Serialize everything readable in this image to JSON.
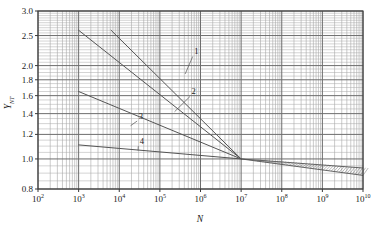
{
  "chart_data": {
    "type": "line",
    "title": "",
    "subtitle": "",
    "xlabel": "N",
    "ylabel": "Y_NT",
    "ylabel_base": "Y",
    "ylabel_sub": "NT",
    "xscale": "log",
    "yscale": "log",
    "xlim": [
      100,
      10000000000
    ],
    "ylim": [
      0.8,
      3.0
    ],
    "grid": true,
    "legend": "none",
    "x_tick_labels": [
      "10²",
      "10³",
      "10⁴",
      "10⁵",
      "10⁶",
      "10⁷",
      "10⁸",
      "10⁹",
      "10¹⁰"
    ],
    "x_tick_bases": [
      "10",
      "10",
      "10",
      "10",
      "10",
      "10",
      "10",
      "10",
      "10"
    ],
    "x_tick_exponents": [
      "2",
      "3",
      "4",
      "5",
      "6",
      "7",
      "8",
      "9",
      "10"
    ],
    "x_tick_values": [
      100,
      1000,
      10000,
      100000,
      1000000,
      10000000,
      100000000,
      1000000000,
      10000000000
    ],
    "y_tick_labels": [
      "0.8",
      "1.0",
      "1.2",
      "1.4",
      "1.6",
      "1.8",
      "2.0",
      "2.5",
      "3.0"
    ],
    "y_tick_values": [
      0.8,
      1.0,
      1.2,
      1.4,
      1.6,
      1.8,
      2.0,
      2.5,
      3.0
    ],
    "series": [
      {
        "name": "1",
        "label": "1",
        "points": [
          [
            6300,
            2.6
          ],
          [
            10000000,
            1.0
          ]
        ],
        "label_position": [
          700000,
          2.18
        ],
        "leader_to": [
          420000,
          1.88
        ]
      },
      {
        "name": "2",
        "label": "2",
        "points": [
          [
            1000,
            2.6
          ],
          [
            10000000,
            1.0
          ]
        ],
        "label_position": [
          600000,
          1.62
        ],
        "leader_to": [
          230000,
          1.42
        ]
      },
      {
        "name": "3",
        "label": "3",
        "points": [
          [
            1000,
            1.65
          ],
          [
            10000000,
            1.0
          ]
        ],
        "label_position": [
          30000,
          1.35
        ],
        "leader_to": [
          19000,
          1.28
        ]
      },
      {
        "name": "4",
        "label": "4",
        "points": [
          [
            1000,
            1.11
          ],
          [
            10000000,
            1.0
          ]
        ],
        "label_position": [
          32000,
          1.12
        ],
        "leader_to": [
          29000,
          1.065
        ]
      }
    ],
    "band": {
      "name": "hatched-band",
      "x_start": 10000000,
      "x_end": 10000000000,
      "y_upper_start": 1.0,
      "y_upper_end": 0.935,
      "y_lower_start": 1.0,
      "y_lower_end": 0.885,
      "hatch": "diagonal"
    },
    "colors": {
      "background": "#ffffff",
      "grid_major": "#6d6d6d",
      "grid_minor": "#a8a8a8",
      "axis": "#3a3a3a",
      "curve": "#555555",
      "text": "#1a1a1a"
    }
  }
}
